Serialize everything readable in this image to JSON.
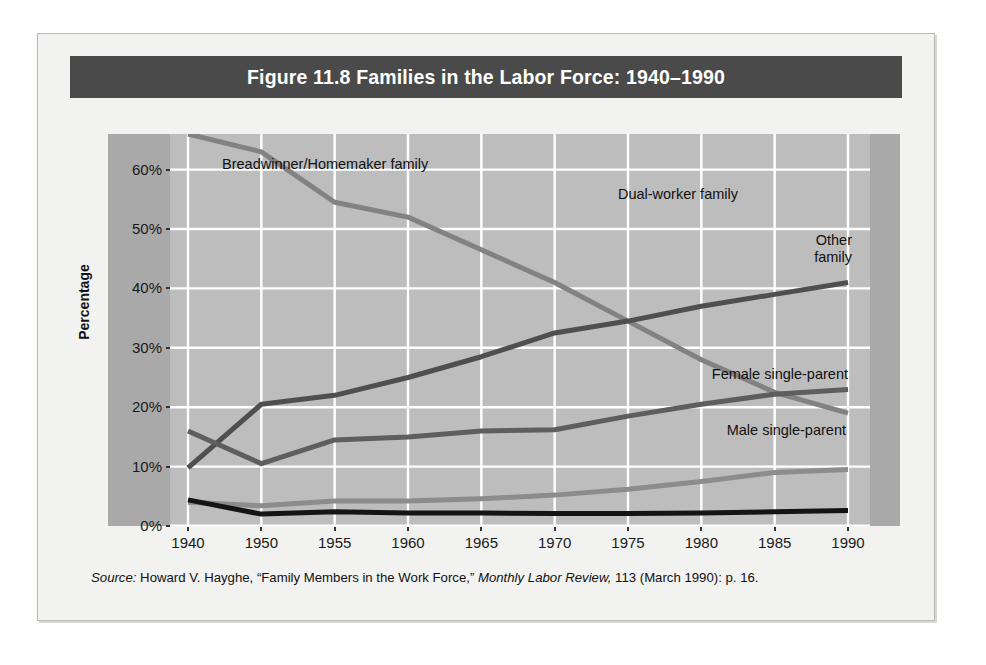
{
  "figure": {
    "title": "Figure 11.8  Families in the Labor Force: 1940–1990",
    "source_prefix": "Source:",
    "source_body_1": " Howard V. Hayghe, “Family Members in the Work Force,” ",
    "source_italic": "Monthly Labor Review,",
    "source_body_2": " 113 (March 1990): p. 16."
  },
  "colors": {
    "title_bar": "#4a4a4a",
    "plot_bg": "#bdbdbd",
    "band": "#a9a9a9",
    "card_bg": "#f2f2f0",
    "gridline": "#ffffff",
    "breadwinner": "#828282",
    "dual_worker": "#4f4f4f",
    "other_family": "#5e5e5e",
    "female_single_parent": "#8c8c8c",
    "male_single_parent": "#141414"
  },
  "annotations": {
    "breadwinner": "Breadwinner/Homemaker family",
    "dual_worker": "Dual-worker family",
    "other_family_line1": "Other",
    "other_family_line2": "family",
    "female_single_parent": "Female single-parent",
    "male_single_parent": "Male single-parent"
  },
  "chart_data": {
    "type": "line",
    "title": "Figure 11.8  Families in the Labor Force: 1940–1990",
    "xlabel": "",
    "ylabel": "Percentage",
    "categories": [
      "1940",
      "1950",
      "1955",
      "1960",
      "1965",
      "1970",
      "1975",
      "1980",
      "1985",
      "1990"
    ],
    "ytick_labels": [
      "0%",
      "10%",
      "20%",
      "30%",
      "40%",
      "50%",
      "60%"
    ],
    "yticks": [
      0,
      10,
      20,
      30,
      40,
      50,
      60
    ],
    "ylim": [
      0,
      66
    ],
    "grid": true,
    "legend_position": "inline-annotations",
    "series": [
      {
        "name": "Breadwinner/Homemaker family",
        "color": "#828282",
        "values": [
          66.0,
          63.0,
          54.5,
          52.0,
          46.5,
          41.0,
          34.5,
          28.0,
          22.5,
          19.0
        ]
      },
      {
        "name": "Dual-worker family",
        "color": "#4f4f4f",
        "values": [
          9.8,
          20.5,
          22.0,
          25.0,
          28.5,
          32.5,
          34.5,
          37.0,
          39.0,
          41.0
        ]
      },
      {
        "name": "Other family",
        "color": "#5e5e5e",
        "values": [
          16.0,
          10.5,
          14.5,
          15.0,
          16.0,
          16.2,
          18.5,
          20.5,
          22.2,
          23.0
        ]
      },
      {
        "name": "Female single-parent",
        "color": "#8c8c8c",
        "values": [
          4.0,
          3.4,
          4.2,
          4.2,
          4.6,
          5.2,
          6.2,
          7.5,
          9.0,
          9.5
        ]
      },
      {
        "name": "Male single-parent",
        "color": "#141414",
        "values": [
          4.4,
          2.0,
          2.4,
          2.2,
          2.2,
          2.1,
          2.1,
          2.2,
          2.4,
          2.6
        ]
      }
    ]
  }
}
